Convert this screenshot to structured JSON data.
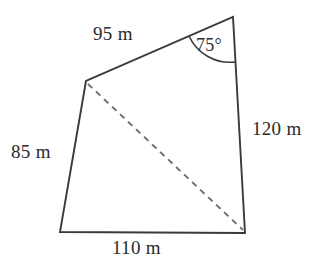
{
  "figure": {
    "type": "quadrilateral-with-diagonal",
    "vertices": {
      "top_right": {
        "x": 233,
        "y": 17
      },
      "upper_left": {
        "x": 86,
        "y": 81
      },
      "bottom_left": {
        "x": 60,
        "y": 232
      },
      "bottom_right": {
        "x": 245,
        "y": 233
      }
    },
    "sides": [
      {
        "name": "top-side",
        "label": "95 m",
        "value": 95,
        "unit": "m",
        "from": "upper_left",
        "to": "top_right",
        "style": "solid"
      },
      {
        "name": "right-side",
        "label": "120 m",
        "value": 120,
        "unit": "m",
        "from": "top_right",
        "to": "bottom_right",
        "style": "solid"
      },
      {
        "name": "bottom-side",
        "label": "110 m",
        "value": 110,
        "unit": "m",
        "from": "bottom_left",
        "to": "bottom_right",
        "style": "solid"
      },
      {
        "name": "left-side",
        "label": "85 m",
        "value": 85,
        "unit": "m",
        "from": "upper_left",
        "to": "bottom_left",
        "style": "solid"
      }
    ],
    "diagonal": {
      "name": "diagonal",
      "from": "upper_left",
      "to": "bottom_right",
      "style": "dashed",
      "label": ""
    },
    "angle": {
      "name": "angle-at-top-right",
      "label": "75°",
      "value": 75,
      "unit": "degrees",
      "at_vertex": "top_right",
      "arc_radius": 45
    },
    "colors": {
      "stroke": "#3a3a3a",
      "dashed_stroke": "#6e6e6e",
      "text": "#2b2b2b",
      "background": "#ffffff"
    }
  },
  "labels": {
    "top_side": "95 m",
    "right_side": "120 m",
    "left_side": "85 m",
    "bottom_side": "110 m",
    "angle": "75°"
  }
}
